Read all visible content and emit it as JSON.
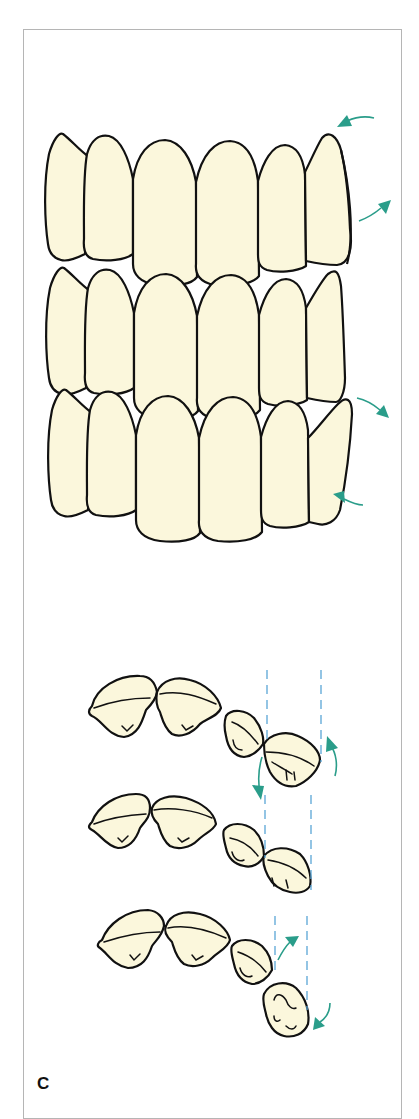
{
  "figure": {
    "panel_label": "C",
    "colors": {
      "tooth_fill": "#fbf7dc",
      "outline": "#111111",
      "arrow": "#2a9d8a",
      "guide_line": "#5aa6d6",
      "frame": "#b5b5b5"
    },
    "views": [
      {
        "name": "labial-view-1",
        "arrows": [
          "counterclockwise-top",
          "clockwise-bottom"
        ]
      },
      {
        "name": "labial-view-2",
        "arrows": []
      },
      {
        "name": "labial-view-3",
        "arrows": [
          "clockwise-top",
          "counterclockwise-bottom"
        ]
      },
      {
        "name": "occlusal-view-1",
        "arrows": [
          "down",
          "up"
        ]
      },
      {
        "name": "occlusal-view-2",
        "arrows": []
      },
      {
        "name": "occlusal-view-3",
        "arrows": [
          "up",
          "down"
        ]
      }
    ]
  }
}
